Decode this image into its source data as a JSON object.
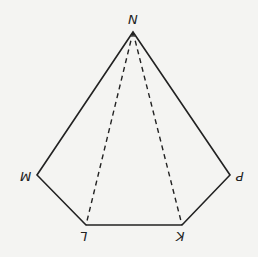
{
  "diagram": {
    "type": "pentagon-with-diagonals",
    "stroke_color": "#222222",
    "background": "#f4f4f2",
    "vertices": [
      {
        "id": "N",
        "label": "N",
        "x": 133,
        "y": 32,
        "rotated": false
      },
      {
        "id": "P",
        "label": "P",
        "x": 230,
        "y": 175,
        "rotated": true
      },
      {
        "id": "K",
        "label": "K",
        "x": 182,
        "y": 225,
        "rotated": true
      },
      {
        "id": "L",
        "label": "L",
        "x": 86,
        "y": 225,
        "rotated": true
      },
      {
        "id": "M",
        "label": "M",
        "x": 37,
        "y": 175,
        "rotated": true
      }
    ],
    "solid_edges": [
      [
        "N",
        "P"
      ],
      [
        "P",
        "K"
      ],
      [
        "K",
        "L"
      ],
      [
        "L",
        "M"
      ],
      [
        "M",
        "N"
      ]
    ],
    "dashed_edges": [
      [
        "N",
        "L"
      ],
      [
        "N",
        "K"
      ]
    ]
  },
  "labels": {
    "N": "N",
    "P": "P",
    "K": "K",
    "L": "L",
    "M": "M"
  }
}
